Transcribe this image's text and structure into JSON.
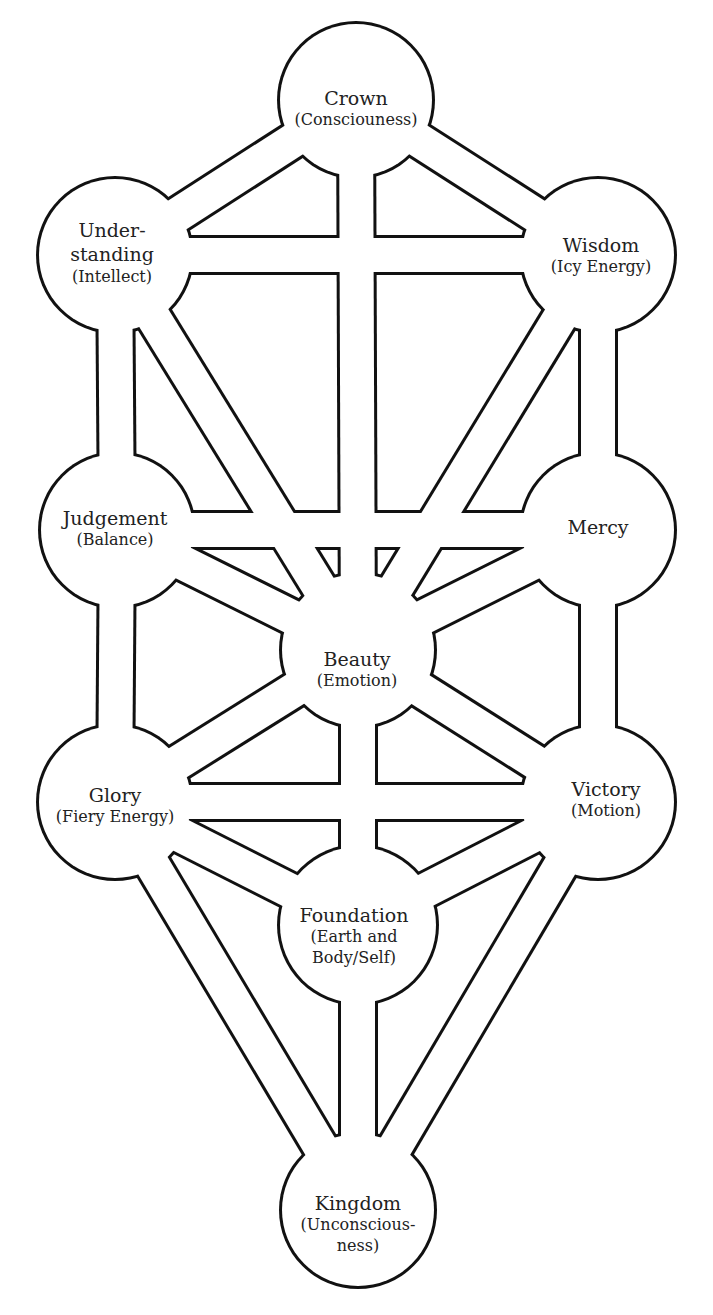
{
  "diagram": {
    "type": "tree-of-life",
    "colors": {
      "stroke": "#111111",
      "fill": "#ffffff",
      "text": "#222222"
    },
    "nodes": [
      {
        "id": "crown",
        "name": "Crown",
        "sub": "(Consciouness)",
        "x": 356,
        "y": 100
      },
      {
        "id": "understanding",
        "name": "Under-\nstanding",
        "name1": "Under-",
        "name2": "standing",
        "sub": "(Intellect)",
        "x": 115,
        "y": 255
      },
      {
        "id": "wisdom",
        "name": "Wisdom",
        "sub": "(Icy Energy)",
        "x": 598,
        "y": 255
      },
      {
        "id": "judgement",
        "name": "Judgement",
        "sub": "(Balance)",
        "x": 117,
        "y": 530
      },
      {
        "id": "mercy",
        "name": "Mercy",
        "sub": "",
        "x": 598,
        "y": 530
      },
      {
        "id": "beauty",
        "name": "Beauty",
        "sub": "(Emotion)",
        "x": 358,
        "y": 650
      },
      {
        "id": "glory",
        "name": "Glory",
        "sub": "(Fiery Energy)",
        "x": 115,
        "y": 802
      },
      {
        "id": "victory",
        "name": "Victory",
        "sub": "(Motion)",
        "x": 598,
        "y": 802
      },
      {
        "id": "foundation",
        "name": "Foundation",
        "sub1": "(Earth and",
        "sub2": "Body/Self)",
        "x": 358,
        "y": 925
      },
      {
        "id": "kingdom",
        "name": "Kingdom",
        "sub1": "(Unconscious-",
        "sub2": "ness)",
        "x": 358,
        "y": 1210
      }
    ],
    "paths": [
      [
        "crown",
        "understanding"
      ],
      [
        "crown",
        "wisdom"
      ],
      [
        "crown",
        "beauty"
      ],
      [
        "understanding",
        "wisdom"
      ],
      [
        "understanding",
        "judgement"
      ],
      [
        "understanding",
        "beauty"
      ],
      [
        "wisdom",
        "mercy"
      ],
      [
        "wisdom",
        "beauty"
      ],
      [
        "judgement",
        "mercy"
      ],
      [
        "judgement",
        "beauty"
      ],
      [
        "judgement",
        "glory"
      ],
      [
        "mercy",
        "beauty"
      ],
      [
        "mercy",
        "victory"
      ],
      [
        "beauty",
        "glory"
      ],
      [
        "beauty",
        "victory"
      ],
      [
        "beauty",
        "foundation"
      ],
      [
        "glory",
        "victory"
      ],
      [
        "glory",
        "foundation"
      ],
      [
        "glory",
        "kingdom"
      ],
      [
        "victory",
        "foundation"
      ],
      [
        "victory",
        "kingdom"
      ],
      [
        "foundation",
        "kingdom"
      ]
    ]
  }
}
